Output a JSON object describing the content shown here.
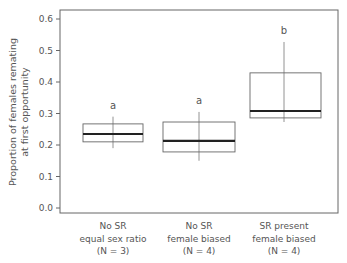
{
  "chart_data": {
    "type": "box",
    "title": "",
    "xlabel": "",
    "ylabel": "Proportion of females remating at first opportunity",
    "ylabel_lines": [
      "Proportion of females remating",
      "at first opportunity"
    ],
    "ylim": [
      0.0,
      0.6
    ],
    "yticks": [
      "0.0",
      "0.1",
      "0.2",
      "0.3",
      "0.4",
      "0.5",
      "0.6"
    ],
    "grid": false,
    "legend": null,
    "categories": [
      {
        "lines": [
          "No SR",
          "equal sex ratio",
          "(N = 3)"
        ],
        "label": "No SR equal sex ratio (N = 3)"
      },
      {
        "lines": [
          "No SR",
          "female biased",
          "(N = 4)"
        ],
        "label": "No SR female biased (N = 4)"
      },
      {
        "lines": [
          "SR present",
          "female biased",
          "(N = 4)"
        ],
        "label": "SR present female biased (N = 4)"
      }
    ],
    "series": [
      {
        "name": "No SR equal sex ratio",
        "whisker_low": 0.19,
        "q1": 0.21,
        "median": 0.235,
        "q3": 0.267,
        "whisker_high": 0.29,
        "significance": "a"
      },
      {
        "name": "No SR female biased",
        "whisker_low": 0.15,
        "q1": 0.178,
        "median": 0.213,
        "q3": 0.273,
        "whisker_high": 0.305,
        "significance": "a"
      },
      {
        "name": "SR present female biased",
        "whisker_low": 0.273,
        "q1": 0.286,
        "median": 0.308,
        "q3": 0.429,
        "whisker_high": 0.527,
        "significance": "b"
      }
    ]
  }
}
